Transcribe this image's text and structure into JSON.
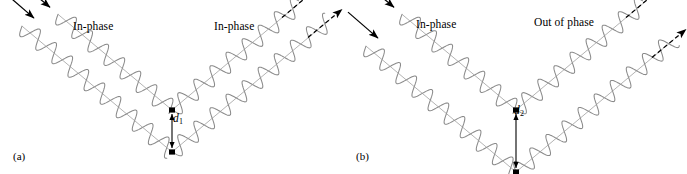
{
  "figure": {
    "background_color": "#ffffff",
    "wave_color": "#8a8a8a",
    "ray_color": "#9a9a9a",
    "arrow_color": "#000000",
    "atom_color": "#000000",
    "width": 687,
    "height": 174
  },
  "panels": [
    {
      "id": "a",
      "caption": "(a)",
      "incoming_label": "In-phase",
      "outgoing_label": "In-phase",
      "spacing_symbol": "d",
      "spacing_subscript": "1",
      "spacing_px": 42,
      "outgoing_phase_shift_deg": 0,
      "description": "Constructive interference: scattered waves remain in phase"
    },
    {
      "id": "b",
      "caption": "(b)",
      "incoming_label": "In-phase",
      "outgoing_label": "Out of phase",
      "spacing_symbol": "d",
      "spacing_subscript": "2",
      "spacing_px": 62,
      "outgoing_phase_shift_deg": 180,
      "description": "Destructive interference: scattered waves emerge out of phase"
    }
  ],
  "geometry": {
    "wave_amplitude_px": 9,
    "wavelength_px": 21,
    "ray_angle_deg": 40,
    "incoming_arrow_style": "solid",
    "outgoing_arrow_style": "dashed",
    "atom_marker": "filled-square-dot",
    "spacing_arrow": "double-headed-vertical"
  },
  "icons": {
    "incoming_arrow": "arrow-down-right-icon",
    "outgoing_arrow": "arrow-up-right-dashed-icon",
    "atom": "atom-dot-icon",
    "spacing_arrow": "double-arrow-vertical-icon"
  }
}
